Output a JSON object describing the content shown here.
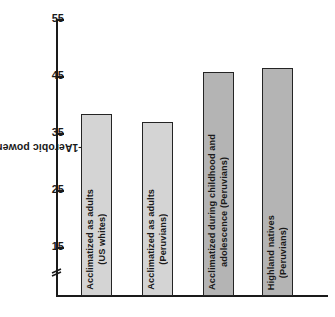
{
  "chart_data": {
    "type": "bar",
    "title": "",
    "xlabel": "",
    "ylabel": "Aerobic power (ml/kg•min⁻¹)",
    "ylabel_main": "Aerobic power (ml/kg•min",
    "ylabel_exponent": "−1",
    "ylabel_tail": ")",
    "ylim": [
      15,
      55
    ],
    "yticks": [
      55,
      45,
      35,
      25,
      15
    ],
    "ytick_labels": [
      "55",
      "45",
      "35",
      "25",
      "15"
    ],
    "axis_broken": true,
    "grid": false,
    "legend": "none",
    "categories": [
      "Acclimatized as adults\n(US whites)",
      "Acclimatized as adults\n(Peruvians)",
      "Acclimatized during childhood and\nadolescence (Peruvians)",
      "Highland natives\n(Peruvians)"
    ],
    "values": [
      38.3,
      36.9,
      45.7,
      46.4
    ],
    "bar_colors": [
      "#d4d4d4",
      "#d4d4d4",
      "#b4b4b4",
      "#b4b4b4"
    ],
    "bar_border_color": "#242424",
    "axis_color": "#1a1a1a",
    "background_color": "#ffffff",
    "bars": [
      {
        "label_line1": "Acclimatized as adults",
        "label_line2": "(US whites)",
        "value": 38.3,
        "color": "#d4d4d4"
      },
      {
        "label_line1": "Acclimatized as adults",
        "label_line2": "(Peruvians)",
        "value": 36.9,
        "color": "#d4d4d4"
      },
      {
        "label_line1": "Acclimatized during childhood and",
        "label_line2": "adolescence (Peruvians)",
        "value": 45.7,
        "color": "#b4b4b4"
      },
      {
        "label_line1": "Highland natives",
        "label_line2": "(Peruvians)",
        "value": 46.4,
        "color": "#b4b4b4"
      }
    ]
  }
}
